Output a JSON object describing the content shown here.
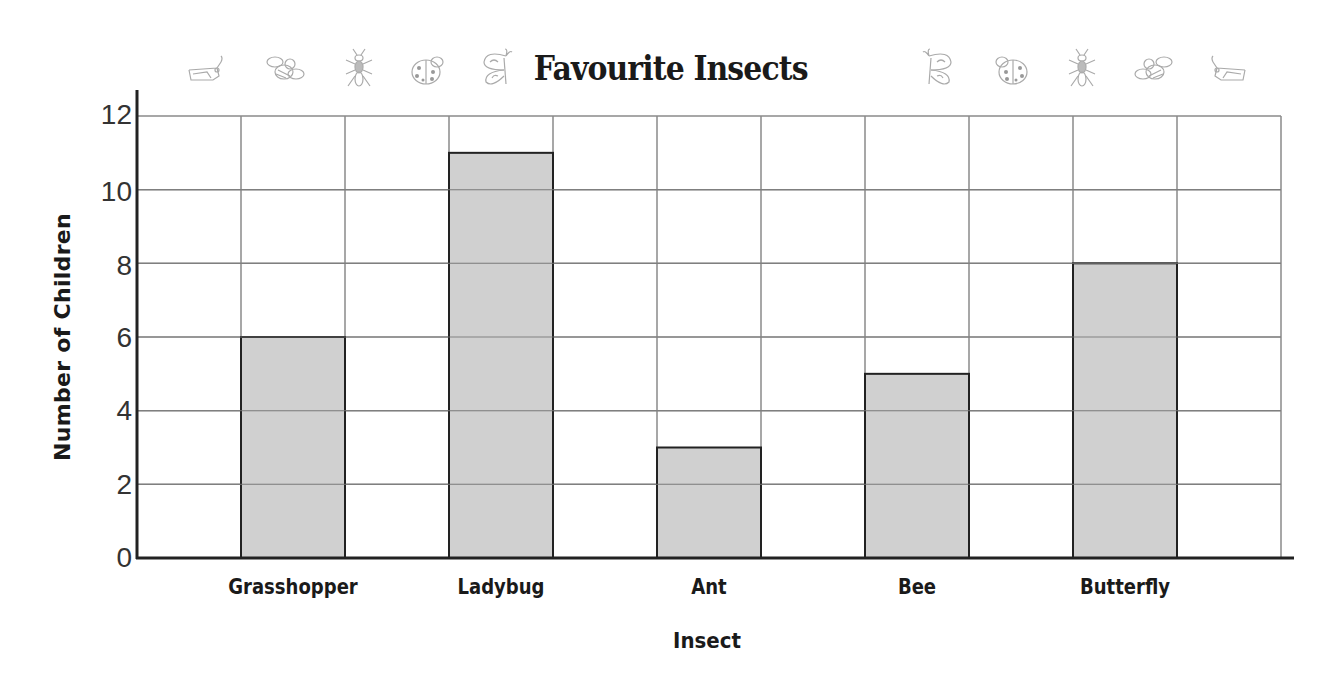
{
  "chart_data": {
    "type": "bar",
    "title": "Favourite Insects",
    "xlabel": "Insect",
    "ylabel": "Number of Children",
    "categories": [
      "Grasshopper",
      "Ladybug",
      "Ant",
      "Bee",
      "Butterfly"
    ],
    "values": [
      6,
      11,
      3,
      5,
      8
    ],
    "ylim": [
      0,
      12
    ],
    "yticks": [
      0,
      2,
      4,
      6,
      8,
      10,
      12
    ],
    "grid": true,
    "legend": null,
    "bar_color": "#c8c8c8",
    "bar_edge_color": "#222222"
  },
  "header": {
    "title": "Favourite Insects",
    "decorations_left": [
      "grasshopper-icon",
      "bee-icon",
      "ant-icon",
      "ladybug-icon",
      "butterfly-icon"
    ],
    "decorations_right": [
      "butterfly-icon",
      "ladybug-icon",
      "ant-icon",
      "bee-icon",
      "grasshopper-icon"
    ]
  },
  "axes": {
    "y_label": "Number of Children",
    "x_label": "Insect",
    "y_ticks": [
      "0",
      "2",
      "4",
      "6",
      "8",
      "10",
      "12"
    ],
    "x_ticks": [
      "Grasshopper",
      "Ladybug",
      "Ant",
      "Bee",
      "Butterfly"
    ]
  }
}
